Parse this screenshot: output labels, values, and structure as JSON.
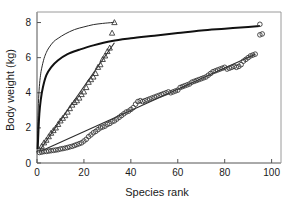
{
  "chart_data": {
    "type": "scatter",
    "title": "",
    "subtitle": "",
    "xlabel": "Species rank",
    "ylabel": "Body weight (kg)",
    "xlim": [
      0,
      104
    ],
    "ylim": [
      0,
      8.6
    ],
    "xticks": [
      0,
      20,
      40,
      60,
      80,
      100
    ],
    "yticks": [
      0,
      2,
      4,
      6,
      8
    ],
    "xtick_labels": [
      "0",
      "20",
      "40",
      "60",
      "80",
      "100"
    ],
    "ytick_labels": [
      "0",
      "2",
      "4",
      "6",
      "8"
    ],
    "grid": false,
    "legend": "none",
    "series": [
      {
        "name": "triangles-series",
        "marker": "triangle-up",
        "x": [
          1,
          2,
          3,
          4,
          5,
          6,
          7,
          8,
          9,
          10,
          11,
          12,
          13,
          14,
          15,
          16,
          17,
          18,
          19,
          20,
          21,
          22,
          23,
          24,
          25,
          26,
          27,
          28,
          29,
          30,
          31,
          32,
          33
        ],
        "y": [
          0.75,
          0.95,
          1.15,
          1.3,
          1.5,
          1.7,
          1.85,
          2.0,
          2.2,
          2.4,
          2.55,
          2.7,
          2.9,
          3.1,
          3.3,
          3.45,
          3.55,
          3.7,
          3.9,
          4.05,
          4.3,
          4.6,
          4.75,
          4.9,
          5.1,
          5.45,
          5.6,
          5.9,
          6.1,
          6.35,
          6.55,
          7.4,
          8.0
        ]
      },
      {
        "name": "circles-series",
        "marker": "circle-open",
        "x": [
          1,
          2,
          3,
          4,
          5,
          6,
          7,
          8,
          9,
          10,
          11,
          12,
          13,
          14,
          15,
          16,
          17,
          18,
          19,
          20,
          21,
          22,
          23,
          24,
          25,
          26,
          27,
          28,
          29,
          30,
          31,
          32,
          33,
          34,
          35,
          36,
          37,
          38,
          39,
          40,
          41,
          42,
          43,
          44,
          45,
          46,
          47,
          48,
          49,
          50,
          51,
          52,
          53,
          54,
          55,
          56,
          57,
          58,
          59,
          60,
          61,
          62,
          63,
          64,
          65,
          66,
          67,
          68,
          69,
          70,
          71,
          72,
          73,
          74,
          75,
          76,
          77,
          78,
          79,
          80,
          81,
          82,
          83,
          84,
          85,
          86,
          87,
          88,
          89,
          90,
          91,
          92,
          93,
          95,
          95,
          96
        ],
        "y": [
          0.6,
          0.62,
          0.65,
          0.66,
          0.68,
          0.7,
          0.72,
          0.74,
          0.76,
          0.8,
          0.82,
          0.85,
          0.88,
          0.92,
          0.95,
          1.0,
          1.05,
          1.1,
          1.15,
          1.25,
          1.35,
          1.5,
          1.6,
          1.72,
          1.8,
          1.9,
          2.0,
          2.05,
          2.1,
          2.2,
          2.25,
          2.35,
          2.4,
          2.5,
          2.6,
          2.7,
          2.8,
          2.9,
          2.95,
          3.05,
          3.15,
          3.35,
          3.5,
          3.55,
          3.5,
          3.55,
          3.6,
          3.65,
          3.7,
          3.75,
          3.8,
          3.85,
          3.9,
          3.95,
          4.0,
          4.05,
          4.0,
          4.05,
          4.1,
          4.15,
          4.3,
          4.35,
          4.4,
          4.45,
          4.5,
          4.6,
          4.65,
          4.7,
          4.75,
          4.8,
          4.85,
          4.9,
          5.0,
          5.1,
          5.2,
          5.25,
          5.3,
          5.35,
          5.4,
          5.45,
          5.35,
          5.4,
          5.45,
          5.5,
          5.45,
          5.5,
          5.6,
          5.8,
          5.9,
          6.0,
          6.1,
          6.15,
          6.2,
          7.9,
          7.3,
          7.35
        ]
      }
    ],
    "fitted_curves": [
      {
        "name": "upper-thin-saturating-curve",
        "style": "thin",
        "x": [
          0.15,
          0.3,
          0.6,
          1,
          1.5,
          2,
          3,
          4,
          5,
          7,
          9,
          12,
          16,
          20,
          24,
          28,
          32,
          33
        ],
        "y": [
          0.8,
          2.0,
          3.4,
          4.35,
          5.0,
          5.4,
          5.95,
          6.3,
          6.55,
          6.9,
          7.1,
          7.35,
          7.6,
          7.75,
          7.88,
          7.95,
          8.0,
          8.02
        ]
      },
      {
        "name": "lower-thick-saturating-curve",
        "style": "thick",
        "x": [
          0.3,
          0.6,
          1,
          1.6,
          2.5,
          4,
          6,
          9,
          13,
          18,
          24,
          32,
          40,
          50,
          60,
          70,
          80,
          90,
          95
        ],
        "y": [
          0.8,
          1.8,
          2.8,
          3.6,
          4.3,
          5.0,
          5.45,
          5.85,
          6.2,
          6.45,
          6.7,
          6.95,
          7.1,
          7.25,
          7.4,
          7.55,
          7.65,
          7.75,
          7.8
        ]
      },
      {
        "name": "triangles-regression-line",
        "style": "line",
        "x": [
          1,
          33
        ],
        "y": [
          0.7,
          6.85
        ]
      },
      {
        "name": "circles-regression-line",
        "style": "line",
        "x": [
          2,
          93
        ],
        "y": [
          0.7,
          6.2
        ]
      }
    ]
  }
}
